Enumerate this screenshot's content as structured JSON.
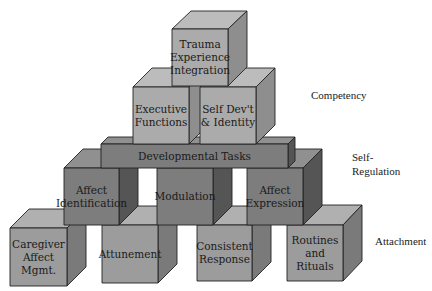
{
  "diagram": {
    "type": "block-pyramid",
    "tiers": [
      {
        "id": "competency",
        "label": "Competency"
      },
      {
        "id": "self-regulation",
        "label": "Self-\nRegulation"
      },
      {
        "id": "attachment",
        "label": "Attachment"
      }
    ],
    "blocks": {
      "trauma": "Trauma\nExperience\nIntegration",
      "executive": "Executive\nFunctions",
      "selfdev": "Self Dev't\n& Identity",
      "devtasks": "Developmental Tasks",
      "affect_id": "Affect\nIdentification",
      "modulation": "Modulation",
      "affect_expr": "Affect\nExpression",
      "caregiver": "Caregiver\nAffect\nMgmt.",
      "attunement": "Attunement",
      "consistent": "Consistent\nResponse",
      "routines": "Routines\nand\nRituals"
    },
    "colors": {
      "light_front": "#ababab",
      "light_top": "#bcbcbc",
      "light_side": "#8e8e8e",
      "dark_front": "#7d7d7d",
      "dark_top": "#909090",
      "dark_side": "#555555",
      "mid_front": "#9c9c9c",
      "mid_top": "#b0b0b0",
      "mid_side": "#7a7a7a"
    }
  }
}
